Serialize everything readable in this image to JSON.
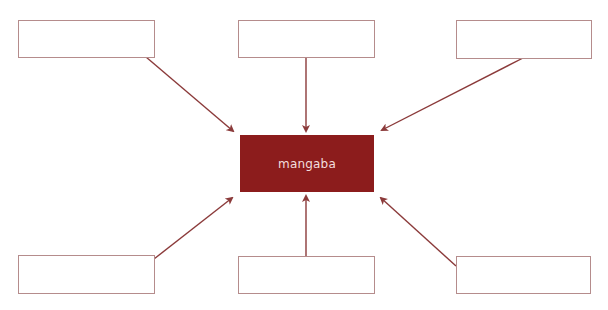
{
  "diagram": {
    "center": {
      "label": "mangaba",
      "fill": "#8c1c1c",
      "text_color": "#f3dede"
    },
    "line_color": "#8b3a3a",
    "box_border_color": "#b58c8c",
    "satellites": [
      {
        "position": "top-left",
        "label": ""
      },
      {
        "position": "top-center",
        "label": ""
      },
      {
        "position": "top-right",
        "label": ""
      },
      {
        "position": "bottom-left",
        "label": ""
      },
      {
        "position": "bottom-center",
        "label": ""
      },
      {
        "position": "bottom-right",
        "label": ""
      }
    ]
  }
}
